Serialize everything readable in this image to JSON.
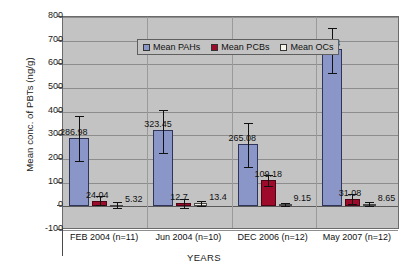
{
  "chart_data": {
    "type": "bar",
    "title": "",
    "xlabel": "YEARS",
    "ylabel": "Mean conc. of PBTs (ng/g)",
    "ylim": [
      -100,
      800
    ],
    "ytick_labels": [
      "800",
      "700",
      "600",
      "500",
      "400",
      "300",
      "200",
      "100",
      "0",
      "-100"
    ],
    "yticks": [
      800,
      700,
      600,
      500,
      400,
      300,
      200,
      100,
      0,
      -100
    ],
    "grid": true,
    "legend_position": "top-left-inside",
    "categories": [
      "FEB 2004 (n=11)",
      "Jun 2004 (n=10)",
      "DEC 2006 (n=12)",
      "May 2007 (n=12)"
    ],
    "series": [
      {
        "name": "Mean PAHs",
        "color": "#8b96c8",
        "values": [
          286.98,
          323.45,
          265.08,
          665.44
        ],
        "labels": [
          "286.98",
          "323.45",
          "265.08",
          "665.44"
        ],
        "error_upper": [
          380,
          408,
          352,
          752
        ],
        "error_lower": [
          190,
          226,
          165,
          563
        ]
      },
      {
        "name": "Mean PCBs",
        "color": "#9e0b2a",
        "values": [
          24.04,
          12.7,
          109.18,
          31.08
        ],
        "labels": [
          "24.04",
          "12.7",
          "109.18",
          "31.08"
        ],
        "error_upper": [
          44,
          33,
          132,
          52
        ],
        "error_lower": [
          4,
          -9,
          86,
          10
        ]
      },
      {
        "name": "Mean OCs",
        "color": "#f3efe2",
        "values": [
          5.32,
          13.4,
          9.15,
          8.65
        ],
        "labels": [
          "5.32",
          "13.4",
          "9.15",
          "8.65"
        ],
        "error_upper": [
          20,
          24,
          16,
          18
        ],
        "error_lower": [
          -8,
          3,
          2,
          0
        ]
      }
    ]
  },
  "axes": {
    "y_title": "Mean conc. of PBTs (ng/g)",
    "x_title": "YEARS"
  },
  "legend": {
    "items": [
      {
        "label": "Mean PAHs",
        "swatch": "pah"
      },
      {
        "label": "Mean PCBs",
        "swatch": "pcb"
      },
      {
        "label": "Mean OCs",
        "swatch": "oc"
      }
    ]
  }
}
